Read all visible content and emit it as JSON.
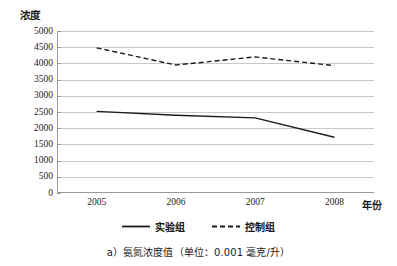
{
  "chart_data": {
    "type": "line",
    "title": "",
    "xlabel": "年份",
    "ylabel": "浓度",
    "categories": [
      "2005",
      "2006",
      "2007",
      "2008"
    ],
    "ylim": [
      0,
      5000
    ],
    "yticks": [
      "0",
      "500",
      "1000",
      "1500",
      "2000",
      "2500",
      "3000",
      "3500",
      "4000",
      "4500",
      "5000"
    ],
    "ytick_values": [
      0,
      500,
      1000,
      1500,
      2000,
      2500,
      3000,
      3500,
      4000,
      4500,
      5000
    ],
    "grid": "horizontal",
    "legend_position": "bottom",
    "series": [
      {
        "name": "实验组",
        "style": "solid",
        "color": "#1a1a1a",
        "values": [
          2520,
          2400,
          2320,
          1720
        ]
      },
      {
        "name": "控制组",
        "style": "dashed",
        "color": "#1a1a1a",
        "values": [
          4480,
          3950,
          4200,
          3930
        ]
      }
    ],
    "annotations": []
  },
  "caption": {
    "text": "a）氨氮浓度值（单位：0.001 毫克/升）"
  },
  "legend": {
    "items": [
      {
        "label": "实验组",
        "style": "solid"
      },
      {
        "label": "控制组",
        "style": "dashed"
      }
    ]
  },
  "colors": {
    "series_line": "#1a1a1a",
    "gridline": "#c9c9c9",
    "axis": "#9a9a9a",
    "text": "#1a1a1a",
    "background": "#ffffff"
  }
}
